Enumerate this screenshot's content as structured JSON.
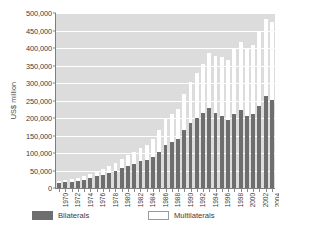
{
  "chart_data": {
    "type": "bar",
    "stacked": true,
    "title": "",
    "xlabel": "",
    "ylabel": "US$ million",
    "ylim": [
      0,
      500000
    ],
    "ytick_labels": [
      "500,000",
      "450,000",
      "400,000",
      "350,000",
      "300,000",
      "250,000",
      "200,000",
      "150,000",
      "100,000",
      "50,000",
      "0"
    ],
    "ytick_values": [
      500000,
      450000,
      400000,
      350000,
      300000,
      250000,
      200000,
      150000,
      100000,
      50000,
      0
    ],
    "grid": true,
    "legend_position": "bottom",
    "categories": [
      "1970",
      "1971",
      "1972",
      "1973",
      "1974",
      "1975",
      "1976",
      "1977",
      "1978",
      "1979",
      "1980",
      "1981",
      "1982",
      "1983",
      "1984",
      "1985",
      "1986",
      "1987",
      "1988",
      "1989",
      "1990",
      "1991",
      "1992",
      "1993",
      "1994",
      "1995",
      "1996",
      "1997",
      "1998",
      "1999",
      "2000",
      "2001",
      "2002",
      "2003",
      "2004"
    ],
    "xtick_labels_shown": [
      "1970",
      "1972",
      "1974",
      "1976",
      "1978",
      "1980",
      "1982",
      "1984",
      "1986",
      "1988",
      "1990",
      "1992",
      "1994",
      "1996",
      "1998",
      "2000",
      "2002",
      "2004"
    ],
    "series": [
      {
        "name": "Bilaterals",
        "color": "#6e6e6e",
        "values": [
          14000,
          16000,
          18000,
          21000,
          24000,
          28000,
          33000,
          38000,
          44000,
          50000,
          58000,
          64000,
          70000,
          76000,
          79000,
          88000,
          104000,
          124000,
          131000,
          139000,
          165000,
          185000,
          200000,
          214000,
          230000,
          215000,
          205000,
          195000,
          212000,
          222000,
          205000,
          212000,
          233000,
          264000,
          252000
        ]
      },
      {
        "name": "Multilaterals",
        "color": "#ffffff",
        "values": [
          5000,
          6000,
          7000,
          8000,
          9000,
          11000,
          13000,
          15000,
          18000,
          21000,
          25000,
          29000,
          33000,
          38000,
          44000,
          52000,
          62000,
          74000,
          80000,
          87000,
          104000,
          118000,
          128000,
          140000,
          155000,
          163000,
          168000,
          172000,
          186000,
          196000,
          191000,
          198000,
          214000,
          220000,
          222000
        ]
      }
    ],
    "totals": [
      19000,
      22000,
      25000,
      29000,
      33000,
      39000,
      46000,
      53000,
      62000,
      71000,
      83000,
      93000,
      103000,
      114000,
      123000,
      140000,
      166000,
      198000,
      211000,
      226000,
      269000,
      303000,
      328000,
      354000,
      385000,
      378000,
      373000,
      367000,
      398000,
      418000,
      396000,
      410000,
      447000,
      484000,
      474000
    ]
  },
  "legend": {
    "entries": [
      {
        "label": "Bilaterals",
        "swatch": "dark-gray"
      },
      {
        "label": "Multilaterals",
        "swatch": "white"
      }
    ]
  }
}
